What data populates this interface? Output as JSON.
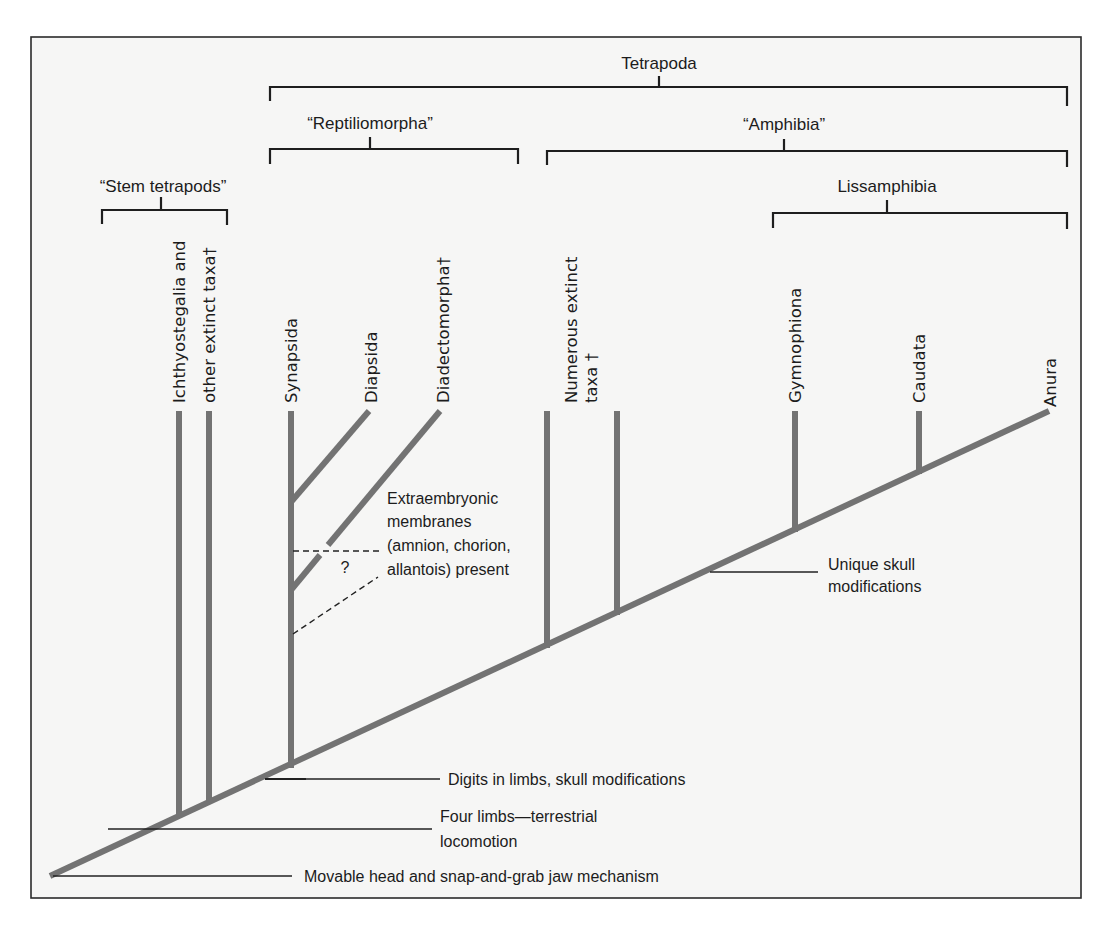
{
  "figure": {
    "type": "cladogram",
    "panel_label": "B"
  },
  "groups": {
    "tetrapoda": "Tetrapoda",
    "reptiliomorpha": "“Reptiliomorpha”",
    "amphibia": "“Amphibia”",
    "stem_tetrapods": "“Stem tetrapods”",
    "lissamphibia": "Lissamphibia"
  },
  "taxa": {
    "ichthyostegalia_line1": "Ichthyostegalia  and",
    "ichthyostegalia_line2": "other extinct taxa†",
    "synapsida": "Synapsida",
    "diapsida": "Diapsida",
    "diadectomorpha": "Diadectomorpha†",
    "numerous_line1": "Numerous extinct",
    "numerous_line2": "taxa †",
    "gymnophiona": "Gymnophiona",
    "caudata": "Caudata",
    "anura": "Anura"
  },
  "characters": {
    "extraembryonic_1": "Extraembryonic",
    "extraembryonic_2": "membranes",
    "extraembryonic_3": "(amnion, chorion,",
    "extraembryonic_4": "allantois) present",
    "uncertain": "?",
    "unique_skull_1": "Unique skull",
    "unique_skull_2": "modifications",
    "digits": "Digits in limbs, skull modifications",
    "four_limbs_1": "Four limbs—terrestrial",
    "four_limbs_2": "locomotion",
    "movable_head": "Movable head and snap-and-grab jaw mechanism"
  },
  "colors": {
    "branch": "#737373",
    "bracket": "#1e1e1e",
    "background": "#f6f6f5",
    "text": "#1c1c1c"
  }
}
